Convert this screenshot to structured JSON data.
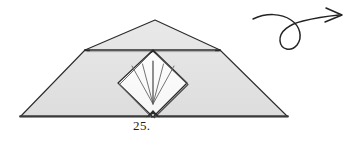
{
  "figure": {
    "kind": "origami-fold-diagram",
    "step_number_label": "25.",
    "colors": {
      "paper_fill": "#e4e4e4",
      "paper_fill_shadow": "#dcdcdc",
      "inner_panel_fill": "#fdfdfd",
      "outline_stroke": "#2b2b2b",
      "crease_stroke": "#555555",
      "arrow_stroke": "#232323",
      "background": "#ffffff"
    },
    "outer_paper": {
      "name": "folded-paper-body",
      "description": "wide low trapezoid-like pentagon with apex at top center",
      "points": "20,117 85,50 155,20 220,50 288,117"
    },
    "horizontal_crease": {
      "name": "horizontal-crease-line",
      "from": [
        85,
        50
      ],
      "to": [
        220,
        50
      ]
    },
    "inner_diamond": {
      "name": "inner-square-panel",
      "top": [
        153,
        50
      ],
      "left": [
        118,
        83
      ],
      "bottom": [
        153,
        117
      ],
      "right": [
        187,
        83
      ]
    },
    "radiating_creases": [
      {
        "name": "crease-ray-1",
        "from": [
          153,
          104
        ],
        "to": [
          132,
          66
        ]
      },
      {
        "name": "crease-ray-2",
        "from": [
          153,
          104
        ],
        "to": [
          142,
          64
        ]
      },
      {
        "name": "crease-ray-3",
        "from": [
          153,
          102
        ],
        "to": [
          153,
          61
        ]
      },
      {
        "name": "crease-ray-4",
        "from": [
          153,
          104
        ],
        "to": [
          164,
          64
        ]
      },
      {
        "name": "crease-ray-5",
        "from": [
          153,
          104
        ],
        "to": [
          174,
          66
        ]
      }
    ],
    "turn_over_arrow": {
      "name": "turn-over-looping-arrow",
      "path": "M 253 19 C 266 13, 281 13, 291 20 C 300 26, 303 37, 297 45 C 291 52, 281 50, 280 41 C 279 31, 290 24, 303 21 C 315 18, 329 16, 339 15",
      "head": "M 326 8 L 342 15 L 325 22"
    }
  }
}
